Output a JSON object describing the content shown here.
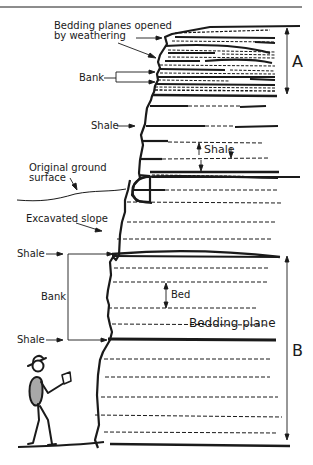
{
  "colors": {
    "ink": "#1a1a1a",
    "person_fill": "#a8a8a8",
    "background": "#ffffff"
  },
  "labels": {
    "bedding_planes_opened_line1": "Bedding planes opened",
    "bedding_planes_opened_line2": "by weathering",
    "bank_top": "Bank",
    "shale_upper": "Shale",
    "shale_between": "Shale",
    "original_ground_line1": "Original ground",
    "original_ground_line2": "surface",
    "excavated_slope": "Excavated slope",
    "shale_bank_top": "Shale",
    "bank_lower": "Bank",
    "shale_bank_bottom": "Shale",
    "bed": "Bed",
    "bedding_plane": "Bedding plane",
    "section_a": "A",
    "section_b": "B"
  }
}
